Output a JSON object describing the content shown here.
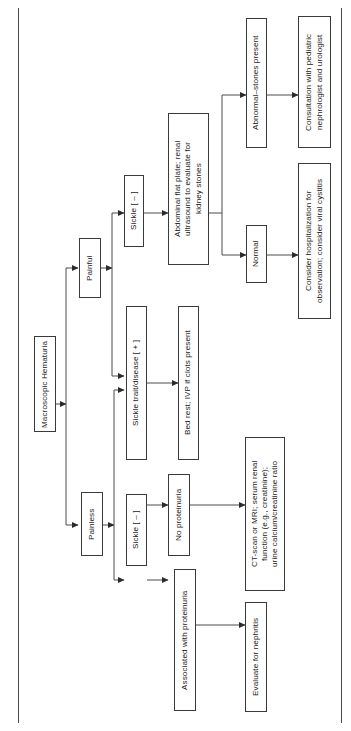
{
  "diagram": {
    "orientation": "rotated-90-clockwise",
    "line_color": "#3a3a3a",
    "text_color": "#1a1a1a",
    "background": "#ffffff",
    "nodes": [
      {
        "id": "root",
        "label": "Macroscopic Hematuria"
      },
      {
        "id": "painful",
        "label": "Painful"
      },
      {
        "id": "painless",
        "label": "Painless"
      },
      {
        "id": "sickle_neg_pain",
        "label": "Sickle [ – ]"
      },
      {
        "id": "sickle_pos",
        "label": "Sickle trait/disease [ + ]"
      },
      {
        "id": "bedrest",
        "label": "Bed rest; IVP if clots present"
      },
      {
        "id": "flatplate",
        "label": "Abdominal flat plate; renal\nultrasound to evaluate for\nkidney stones"
      },
      {
        "id": "abnormal",
        "label": "Abnormal–stones present"
      },
      {
        "id": "normal",
        "label": "Normal"
      },
      {
        "id": "consult",
        "label": "Consultation with pediatric\nnephrologist and urologist"
      },
      {
        "id": "hospitalize",
        "label": "Consider hospitalization for\nobservation; consider viral cystitis"
      },
      {
        "id": "sickle_neg_less",
        "label": "Sickle [ – ]"
      },
      {
        "id": "no_proteinuria",
        "label": "No proteinuria"
      },
      {
        "id": "with_proteinuria",
        "label": "Associated with proteinuria"
      },
      {
        "id": "ctmri",
        "label": "CT-scan or MRI; serum renal\nfunction (e.g., creatinine);\nurine calcium/creatinine ratio"
      },
      {
        "id": "nephritis",
        "label": "Evaluate for nephritis"
      }
    ],
    "edges": [
      {
        "from": "root",
        "to": "painful"
      },
      {
        "from": "root",
        "to": "painless"
      },
      {
        "from": "painful",
        "to": "sickle_neg_pain"
      },
      {
        "from": "painful",
        "to": "sickle_pos"
      },
      {
        "from": "painless",
        "to": "sickle_pos"
      },
      {
        "from": "painless",
        "to": "sickle_neg_less"
      },
      {
        "from": "sickle_pos",
        "to": "bedrest"
      },
      {
        "from": "sickle_neg_pain",
        "to": "flatplate"
      },
      {
        "from": "flatplate",
        "to": "abnormal"
      },
      {
        "from": "flatplate",
        "to": "normal"
      },
      {
        "from": "abnormal",
        "to": "consult"
      },
      {
        "from": "normal",
        "to": "hospitalize"
      },
      {
        "from": "sickle_neg_less",
        "to": "no_proteinuria"
      },
      {
        "from": "sickle_neg_less",
        "to": "with_proteinuria"
      },
      {
        "from": "no_proteinuria",
        "to": "ctmri"
      },
      {
        "from": "with_proteinuria",
        "to": "nephritis"
      }
    ]
  }
}
